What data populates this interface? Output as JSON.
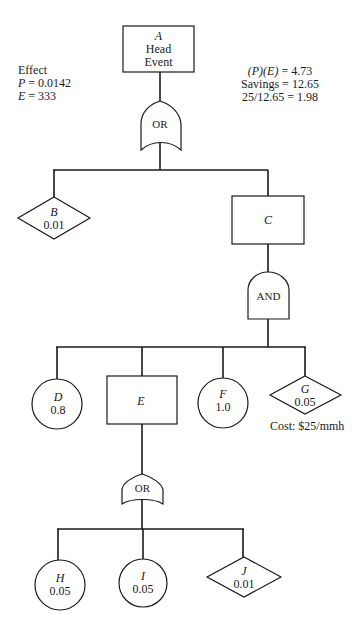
{
  "diagram": {
    "type": "fault-tree",
    "nodes": {
      "A": {
        "id": "A",
        "shape": "rectangle",
        "line1": "Head",
        "line2": "Event"
      },
      "gate1": {
        "type": "OR",
        "label": "OR"
      },
      "B": {
        "id": "B",
        "shape": "diamond",
        "value": "0.01"
      },
      "C": {
        "id": "C",
        "shape": "rectangle"
      },
      "gate2": {
        "type": "AND",
        "label": "AND"
      },
      "D": {
        "id": "D",
        "shape": "circle",
        "value": "0.8"
      },
      "E": {
        "id": "E",
        "shape": "rectangle"
      },
      "F": {
        "id": "F",
        "shape": "circle",
        "value": "1.0"
      },
      "G": {
        "id": "G",
        "shape": "diamond",
        "value": "0.05"
      },
      "gate3": {
        "type": "OR",
        "label": "OR"
      },
      "H": {
        "id": "H",
        "shape": "circle",
        "value": "0.05"
      },
      "I": {
        "id": "I",
        "shape": "circle",
        "value": "0.05"
      },
      "J": {
        "id": "J",
        "shape": "diamond",
        "value": "0.01"
      }
    },
    "edges": [
      [
        "A",
        "gate1"
      ],
      [
        "gate1",
        "B"
      ],
      [
        "gate1",
        "C"
      ],
      [
        "C",
        "gate2"
      ],
      [
        "gate2",
        "D"
      ],
      [
        "gate2",
        "E"
      ],
      [
        "gate2",
        "F"
      ],
      [
        "gate2",
        "G"
      ],
      [
        "E",
        "gate3"
      ],
      [
        "gate3",
        "H"
      ],
      [
        "gate3",
        "I"
      ],
      [
        "gate3",
        "J"
      ]
    ],
    "annotations": {
      "effect": {
        "title": "Effect",
        "p_var": "P",
        "p_eq": " = 0.0142",
        "e_var": "E",
        "e_eq": " = 333"
      },
      "calc": {
        "pe_expr": "(P)(E)",
        "pe_eq": " = 4.73",
        "savings": "Savings = 12.65",
        "ratio": "25/12.65 = 1.98"
      },
      "cost": "Cost: $25/mmh"
    }
  }
}
